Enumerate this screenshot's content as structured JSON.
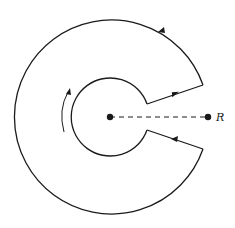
{
  "diagram": {
    "title": "",
    "labels": {
      "point_r": "R"
    },
    "colors": {
      "stroke": "#1a1a1a",
      "background": "#ffffff"
    },
    "elements": [
      {
        "id": "outer-arc",
        "type": "arc",
        "direction": "counterclockwise"
      },
      {
        "id": "inner-arc",
        "type": "arc",
        "direction": "clockwise"
      },
      {
        "id": "upper-segment",
        "type": "line",
        "direction": "outward"
      },
      {
        "id": "lower-segment",
        "type": "line",
        "direction": "inward"
      },
      {
        "id": "cut-line",
        "type": "dashed-line"
      },
      {
        "id": "origin-point",
        "type": "point"
      },
      {
        "id": "point-r",
        "type": "point",
        "label": "R"
      },
      {
        "id": "orientation-arrow",
        "type": "curved-arrow"
      }
    ]
  }
}
